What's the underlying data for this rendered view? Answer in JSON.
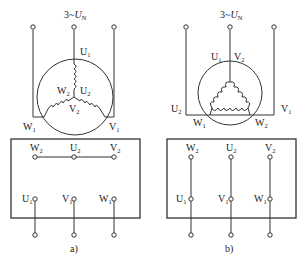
{
  "figure": {
    "panels": [
      {
        "id": "a",
        "caption": "a)",
        "connection": "star (Y)",
        "supply_label": {
          "prefix": "3~",
          "var": "U",
          "sub": "N"
        },
        "winding_labels": {
          "U1": {
            "main": "U",
            "sub": "1"
          },
          "U2": {
            "main": "U",
            "sub": "2"
          },
          "V1": {
            "main": "V",
            "sub": "1"
          },
          "V2": {
            "main": "V",
            "sub": "2"
          },
          "W1": {
            "main": "W",
            "sub": "1"
          },
          "W2": {
            "main": "W",
            "sub": "2"
          }
        },
        "terminal_box": {
          "top_row": [
            {
              "main": "W",
              "sub": "2"
            },
            {
              "main": "U",
              "sub": "2"
            },
            {
              "main": "V",
              "sub": "2"
            }
          ],
          "bottom_row": [
            {
              "main": "U",
              "sub": "1"
            },
            {
              "main": "V",
              "sub": "1"
            },
            {
              "main": "W",
              "sub": "1"
            }
          ],
          "links": "horizontal bar joining W2-U2-V2"
        }
      },
      {
        "id": "b",
        "caption": "b)",
        "connection": "delta (Δ)",
        "supply_label": {
          "prefix": "3~",
          "var": "U",
          "sub": "N"
        },
        "winding_labels": {
          "U1": {
            "main": "U",
            "sub": "1"
          },
          "U2": {
            "main": "U",
            "sub": "2"
          },
          "V1": {
            "main": "V",
            "sub": "1"
          },
          "V2": {
            "main": "V",
            "sub": "2"
          },
          "W1": {
            "main": "W",
            "sub": "1"
          },
          "W2": {
            "main": "W",
            "sub": "2"
          }
        },
        "terminal_box": {
          "top_row": [
            {
              "main": "W",
              "sub": "2"
            },
            {
              "main": "U",
              "sub": "2"
            },
            {
              "main": "V",
              "sub": "2"
            }
          ],
          "bottom_row": [
            {
              "main": "U",
              "sub": "1"
            },
            {
              "main": "V",
              "sub": "1"
            },
            {
              "main": "W",
              "sub": "1"
            }
          ],
          "links": "vertical bars joining W2-U1, U2-V1, V2-W1"
        }
      }
    ]
  }
}
